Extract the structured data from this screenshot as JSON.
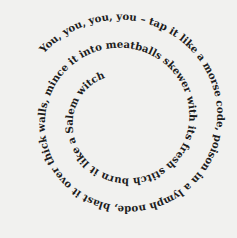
{
  "poem": {
    "spiral_text": "You, you, you, you  –  tap it like a morse code, poison in a lymph node, blast it over thick walls,   mince it into meatballs skewer with its fresh stitch   burn it like a Salem witch",
    "segments": [
      "You, you, you, you",
      "–",
      "tap it like a morse code,",
      "poison in a lymph node,",
      "blast it over thick walls,",
      "mince it into",
      "meatballs",
      "skewer with its",
      "fresh stitch",
      "burn it like a Salem witch"
    ]
  },
  "colors": {
    "background": "#f1f1ef",
    "text": "#1d1d1d"
  }
}
